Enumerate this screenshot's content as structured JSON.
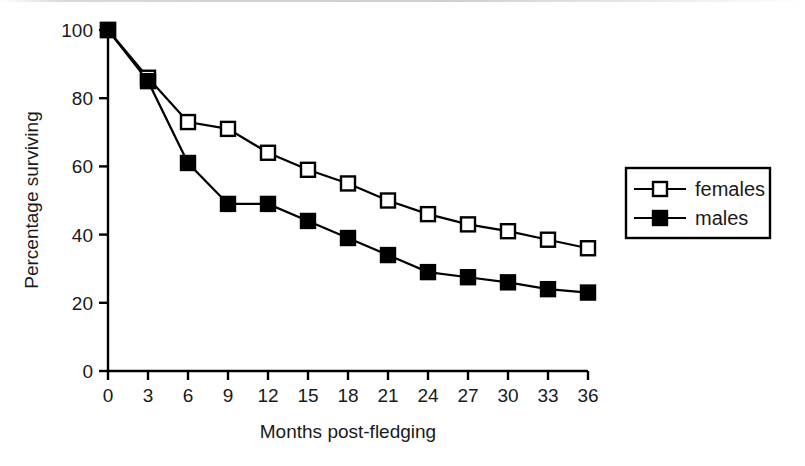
{
  "figure": {
    "background_color": "#ffffff",
    "ink_color": "#000000"
  },
  "chart_data": {
    "type": "line",
    "title": "",
    "xlabel": "Months post-fledging",
    "ylabel": "Percentage surviving",
    "x": [
      0,
      3,
      6,
      9,
      12,
      15,
      18,
      21,
      24,
      27,
      30,
      33,
      36
    ],
    "xlim": [
      0,
      36
    ],
    "ylim": [
      0,
      100
    ],
    "xticks": [
      0,
      3,
      6,
      9,
      12,
      15,
      18,
      21,
      24,
      27,
      30,
      33,
      36
    ],
    "xtick_labels": [
      "0",
      "3",
      "6",
      "9",
      "12",
      "15",
      "18",
      "21",
      "24",
      "27",
      "30",
      "33",
      "36"
    ],
    "yticks": [
      0,
      20,
      40,
      60,
      80,
      100
    ],
    "ytick_labels": [
      "0",
      "20",
      "40",
      "60",
      "80",
      "100"
    ],
    "grid": false,
    "legend_position": "right-outside",
    "series": [
      {
        "name": "females",
        "marker": "open-square",
        "marker_fill": "#ffffff",
        "marker_edge": "#000000",
        "line_color": "#000000",
        "values": [
          100,
          86,
          73,
          71,
          64,
          59,
          55,
          50,
          46,
          43,
          41,
          38.5,
          36
        ]
      },
      {
        "name": "males",
        "marker": "filled-square",
        "marker_fill": "#000000",
        "marker_edge": "#000000",
        "line_color": "#000000",
        "values": [
          100,
          85,
          61,
          49,
          49,
          44,
          39,
          34,
          29,
          27.5,
          26,
          24,
          23
        ]
      }
    ]
  },
  "legend": {
    "entries": [
      {
        "label": "females",
        "marker": "open-square"
      },
      {
        "label": "males",
        "marker": "filled-square"
      }
    ]
  }
}
